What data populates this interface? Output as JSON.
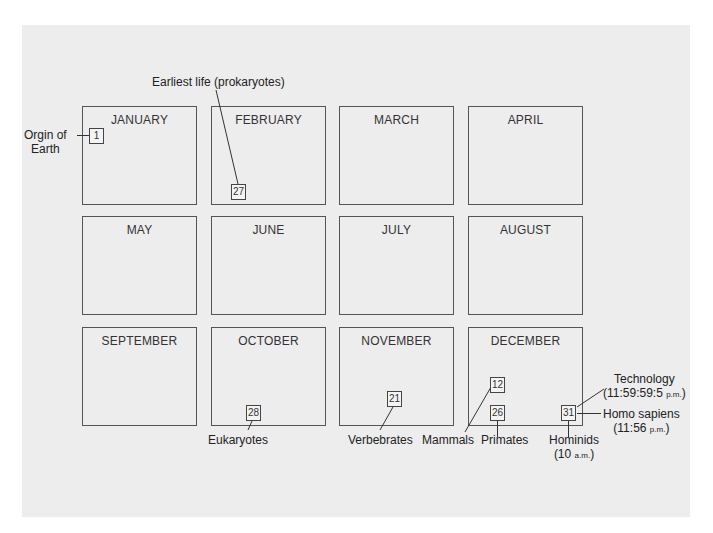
{
  "months": [
    "JANUARY",
    "FEBRUARY",
    "MARCH",
    "APRIL",
    "MAY",
    "JUNE",
    "JULY",
    "AUGUST",
    "SEPTEMBER",
    "OCTOBER",
    "NOVEMBER",
    "DECEMBER"
  ],
  "days": {
    "jan1": "1",
    "feb27": "27",
    "oct28": "28",
    "nov21": "21",
    "dec12": "12",
    "dec26": "26",
    "dec31": "31"
  },
  "annotations": {
    "origin_line1": "Orgin of",
    "origin_line2": "Earth",
    "earliest_life": "Earliest life (prokaryotes)",
    "eukaryotes": "Eukaryotes",
    "vertebrates": "Verbebrates",
    "mammals": "Mammals",
    "primates": "Primates",
    "hominids": "Hominids",
    "hominids_time_num": "(10 ",
    "hominids_time_suffix": "a.m.",
    "hominids_time_close": ")",
    "technology": "Technology",
    "technology_time_num": "(11:59:59:5 ",
    "technology_time_suffix": "p.m.",
    "technology_time_close": ")",
    "homo_sapiens": "Homo sapiens",
    "homo_sapiens_time_num": "(11:56 ",
    "homo_sapiens_time_suffix": "p.m.",
    "homo_sapiens_time_close": ")"
  },
  "colors": {
    "background": "#ededed",
    "stroke": "#555555"
  }
}
